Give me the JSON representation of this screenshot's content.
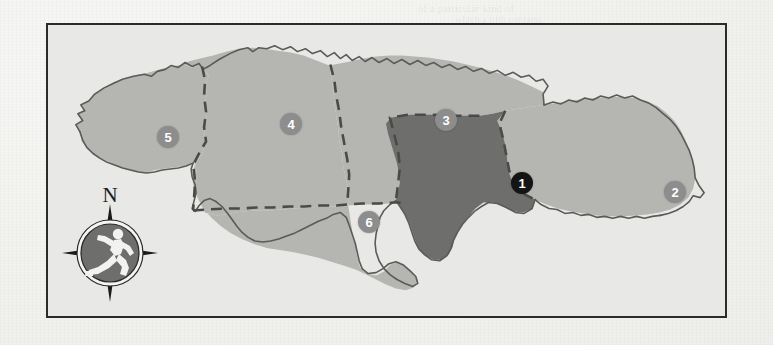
{
  "page": {
    "background_color": "#f1f1ee",
    "ghost_texts": [
      {
        "text": "of a particular kind  of",
        "x": 418,
        "y": 2,
        "size": 11
      },
      {
        "text": "which a fifth contains",
        "x": 455,
        "y": 14,
        "size": 10
      },
      {
        "text": "Trinidad",
        "x": 580,
        "y": 60,
        "size": 17
      },
      {
        "text": "Tobago",
        "x": 560,
        "y": 88,
        "size": 11
      },
      {
        "text": "in the context of",
        "x": 300,
        "y": 120,
        "size": 10
      },
      {
        "text": "country's border  map is",
        "x": 420,
        "y": 175,
        "size": 11
      },
      {
        "text": "region",
        "x": 236,
        "y": 212,
        "size": 10
      }
    ]
  },
  "map": {
    "title": "Jamaica regions map",
    "frame": {
      "x": 46,
      "y": 23,
      "width": 681,
      "height": 295,
      "border_color": "#2b2b2b"
    },
    "colors": {
      "sea": "#e8e8e6",
      "land": "#b5b5b2",
      "land_highlight": "#6e6e6d",
      "coastline": "#5a5a58",
      "internal_border": "#4a4a48",
      "marker_normal": "#8d8d8d",
      "marker_highlight": "#141414",
      "marker_text": "#ffffff"
    },
    "regions": [
      {
        "id": 1,
        "label": "1",
        "style": "highlight",
        "marker_x": 474,
        "marker_y": 158
      },
      {
        "id": 2,
        "label": "2",
        "style": "normal",
        "marker_x": 627,
        "marker_y": 167
      },
      {
        "id": 3,
        "label": "3",
        "style": "normal",
        "marker_x": 398,
        "marker_y": 95
      },
      {
        "id": 4,
        "label": "4",
        "style": "normal",
        "marker_x": 243,
        "marker_y": 99
      },
      {
        "id": 5,
        "label": "5",
        "style": "normal",
        "marker_x": 120,
        "marker_y": 112
      },
      {
        "id": 6,
        "label": "6",
        "style": "normal",
        "marker_x": 321,
        "marker_y": 197
      }
    ],
    "compass": {
      "x": 60,
      "y": 182,
      "north_label": "N",
      "icon": "running-person-icon",
      "disc_color": "#6e6e6d",
      "ring_color": "#2a2a2a",
      "point_color": "#1a1a1a",
      "figure_color": "#f2f2f0"
    }
  }
}
